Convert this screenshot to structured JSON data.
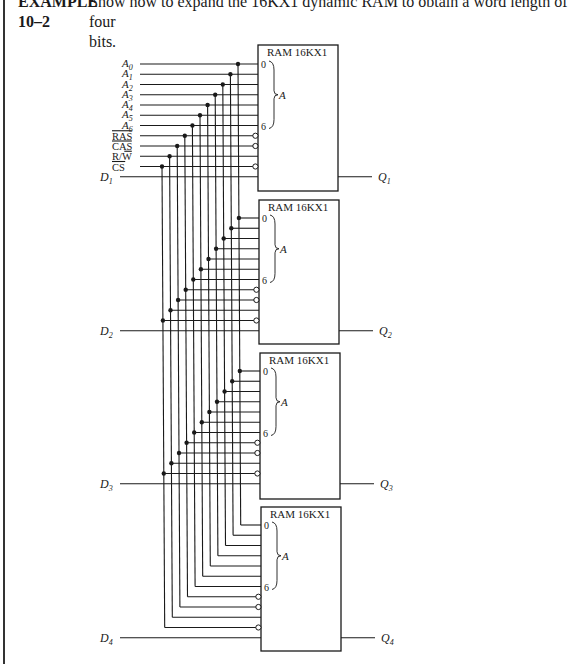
{
  "header": {
    "example_label_line1": "EXAMPLE",
    "example_label_line2": "10–2",
    "prompt_line1": "Show how to expand the 16KX1 dynamic RAM to obtain a word length of four",
    "prompt_line2": "bits."
  },
  "diagram": {
    "input_signals": [
      "A0",
      "A1",
      "A2",
      "A3",
      "A4",
      "A5",
      "A6",
      "RAS",
      "CAS",
      "R/W",
      "CS"
    ],
    "input_labels": [
      {
        "main": "A",
        "sub": "0"
      },
      {
        "main": "A",
        "sub": "1"
      },
      {
        "main": "A",
        "sub": "2"
      },
      {
        "main": "A",
        "sub": "3"
      },
      {
        "main": "A",
        "sub": "4"
      },
      {
        "main": "A",
        "sub": "5"
      },
      {
        "main": "A",
        "sub": "6"
      },
      {
        "main": "RAS",
        "overline": true
      },
      {
        "main": "CAS",
        "overline": true
      },
      {
        "main": "R/W",
        "overline_part": "W"
      },
      {
        "main": "CS",
        "overline": true
      }
    ],
    "chips": [
      {
        "title": "RAM 16KX1",
        "addr_first": "0",
        "addr_last": "6",
        "addr_group": "A",
        "data_in": "D",
        "data_in_sub": "1",
        "data_out": "Q",
        "data_out_sub": "1"
      },
      {
        "title": "RAM 16KX1",
        "addr_first": "0",
        "addr_last": "6",
        "addr_group": "A",
        "data_in": "D",
        "data_in_sub": "2",
        "data_out": "Q",
        "data_out_sub": "2"
      },
      {
        "title": "RAM 16KX1",
        "addr_first": "0",
        "addr_last": "6",
        "addr_group": "A",
        "data_in": "D",
        "data_in_sub": "3",
        "data_out": "Q",
        "data_out_sub": "3"
      },
      {
        "title": "RAM 16KX1",
        "addr_first": "0",
        "addr_last": "6",
        "addr_group": "A",
        "data_in": "D",
        "data_in_sub": "4",
        "data_out": "Q",
        "data_out_sub": "4"
      }
    ],
    "inverted_inputs": [
      "RAS",
      "CAS",
      "CS"
    ]
  }
}
